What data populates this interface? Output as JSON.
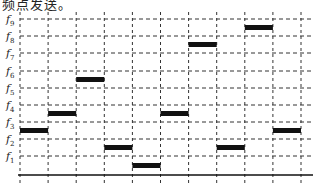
{
  "caption": "频点发送。",
  "chart_data": {
    "type": "diagram",
    "y_levels": [
      "f1",
      "f2",
      "f3",
      "f4",
      "f5",
      "f6",
      "f7",
      "f8",
      "f9"
    ],
    "x_slots": 10,
    "grid": "dashed",
    "bars": [
      {
        "slot": 1,
        "between": [
          "f2",
          "f3"
        ]
      },
      {
        "slot": 2,
        "between": [
          "f3",
          "f4"
        ]
      },
      {
        "slot": 3,
        "between": [
          "f5",
          "f6"
        ]
      },
      {
        "slot": 4,
        "between": [
          "f1",
          "f2"
        ]
      },
      {
        "slot": 5,
        "between": [
          "axis",
          "f1"
        ]
      },
      {
        "slot": 6,
        "between": [
          "f3",
          "f4"
        ]
      },
      {
        "slot": 7,
        "between": [
          "f7",
          "f8"
        ]
      },
      {
        "slot": 8,
        "between": [
          "f1",
          "f2"
        ]
      },
      {
        "slot": 9,
        "between": [
          "f8",
          "f9"
        ]
      },
      {
        "slot": 10,
        "between": [
          "f2",
          "f3"
        ]
      }
    ]
  },
  "colors": {
    "bar": "#111111",
    "grid": "#333333"
  }
}
